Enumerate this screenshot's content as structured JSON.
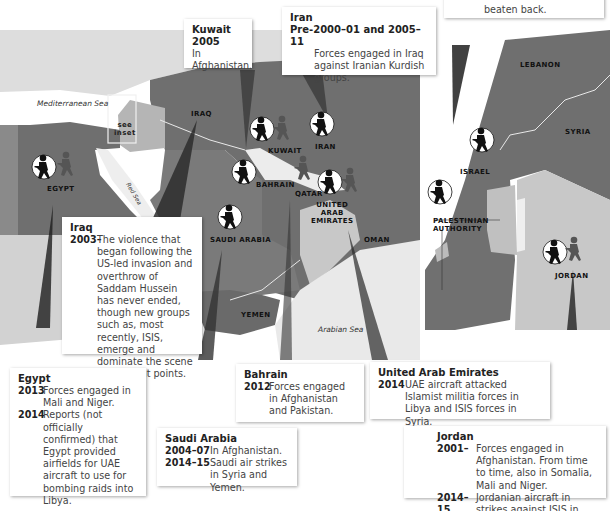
{
  "map": {
    "seas": {
      "mediterranean": "Mediterranean Sea",
      "red": "Red Sea",
      "arabian": "Arabian Sea"
    },
    "inset_note": "see\ninset",
    "countries": {
      "egypt": "EGYPT",
      "iraq": "IRAQ",
      "kuwait": "KUWAIT",
      "iran": "IRAN",
      "bahrain": "BAHRAIN",
      "qatar": "QATAR",
      "uae": "UNITED\nARAB\nEMIRATES",
      "saudi": "SAUDI ARABIA",
      "oman": "OMAN",
      "yemen": "YEMEN"
    },
    "inset_countries": {
      "lebanon": "LEBANON",
      "syria": "SYRIA",
      "israel": "ISRAEL",
      "palestinian": "PALESTINIAN\nAUTHORITY",
      "jordan": "JORDAN"
    },
    "colors": {
      "land_dark": "#6e6e6e",
      "land_mid": "#8f8f8f",
      "land_light": "#bdbdbd",
      "land_faint": "#dcdcdc",
      "sea": "#ffffff",
      "border": "#e8e8e8"
    }
  },
  "callouts": {
    "top_right": {
      "text": "beaten back."
    },
    "kuwait": {
      "title": "Kuwait",
      "entries": [
        {
          "year": "2005",
          "text": "In Afghanistan."
        }
      ]
    },
    "iran": {
      "title": "Iran",
      "entries": [
        {
          "year": "Pre-2000–01 and 2005–11",
          "text": "Forces engaged in Iraq against Iranian Kurdish groups."
        }
      ]
    },
    "iraq": {
      "title": "Iraq",
      "entries": [
        {
          "year": "2003–",
          "text": "The violence that began following the US-led invasion and overthrow of Saddam Hussein has never ended, though new groups such as, most recently, ISIS, emerge and dominate the scene at different points."
        }
      ]
    },
    "egypt": {
      "title": "Egypt",
      "entries": [
        {
          "year": "2013",
          "text": "Forces engaged in Mali and Niger."
        },
        {
          "year": "2014",
          "text": "Reports (not officially confirmed) that Egypt provided airfields for UAE aircraft to use for bombing raids into Libya."
        }
      ]
    },
    "bahrain": {
      "title": "Bahrain",
      "entries": [
        {
          "year": "2012",
          "text": "Forces engaged in Afghanistan and Pakistan."
        }
      ]
    },
    "uae": {
      "title": "United Arab Emirates",
      "entries": [
        {
          "year": "2014",
          "text": "UAE aircraft attacked Islamist militia forces in Libya and ISIS forces in Syria."
        }
      ]
    },
    "saudi": {
      "title": "Saudi Arabia",
      "entries": [
        {
          "year": "2004–07",
          "text": "In Afghanistan."
        },
        {
          "year": "2014–15",
          "text": "Saudi air strikes in Syria and Yemen."
        }
      ]
    },
    "jordan": {
      "title": "Jordan",
      "entries": [
        {
          "year": "2001–",
          "text": "Forces engaged in Afghanistan. From time to time, also in Somalia, Mali and Niger."
        },
        {
          "year": "2014–15",
          "text": "Jordanian aircraft in strikes against ISIS in Syria."
        }
      ]
    }
  },
  "icons": {
    "soldier_in_circle": "soldier-fighting-at-home-icon",
    "soldier_grey": "soldier-fighting-abroad-icon"
  }
}
